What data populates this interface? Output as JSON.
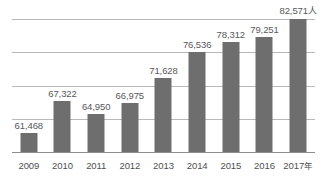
{
  "chart_data": {
    "type": "bar",
    "title": "",
    "subtitle": "",
    "xlabel": "",
    "ylabel": "",
    "categories": [
      "2009",
      "2010",
      "2011",
      "2012",
      "2013",
      "2014",
      "2015",
      "2016",
      "2017"
    ],
    "tick_labels": [
      "2009",
      "2010",
      "2011",
      "2012",
      "2013",
      "2014",
      "2015",
      "2016",
      "2017年"
    ],
    "values": [
      61468,
      67322,
      64950,
      66975,
      71628,
      76536,
      78312,
      79251,
      82571
    ],
    "value_labels": [
      "61,468",
      "67,322",
      "64,950",
      "66,975",
      "71,628",
      "76,536",
      "78,312",
      "79,251",
      "82,571人"
    ],
    "unit_suffix": "人",
    "x_unit_suffix": "年",
    "ylim": [
      57900,
      82600
    ],
    "grid": true,
    "gridline_count": 5,
    "legend": "none",
    "bar_color": "#6e6e6e",
    "gridline_color": "#b9b9b9",
    "axis_color": "#8e8e8e",
    "label_color": "#58585a",
    "background_color": "#ffffff"
  }
}
